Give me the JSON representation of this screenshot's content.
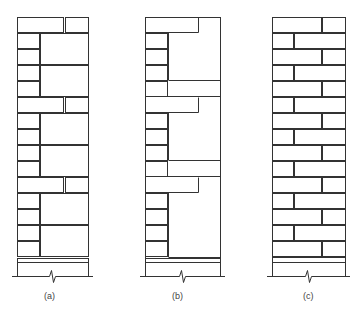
{
  "figure": {
    "type": "masonry-bond-elevations",
    "stroke_color": "#333333",
    "joint_color": "#9a9a9a",
    "panels": [
      {
        "id": "a",
        "caption": "(a)",
        "caption_x": 44,
        "description": "Stacked blocks with alternating half-units and full-height infill blocks",
        "x0": 17,
        "x1": 88,
        "top": 17,
        "bottom": 262,
        "ground": 276,
        "rects": [
          [
            17,
            17,
            46,
            15
          ],
          [
            65,
            17,
            23,
            15
          ],
          [
            17,
            33,
            22,
            15
          ],
          [
            17,
            49,
            22,
            15
          ],
          [
            40,
            33,
            48,
            31
          ],
          [
            17,
            65,
            22,
            15
          ],
          [
            17,
            81,
            22,
            15
          ],
          [
            40,
            65,
            48,
            31
          ],
          [
            17,
            97,
            46,
            15
          ],
          [
            65,
            97,
            23,
            15
          ],
          [
            17,
            113,
            22,
            15
          ],
          [
            17,
            129,
            22,
            15
          ],
          [
            40,
            113,
            48,
            31
          ],
          [
            17,
            145,
            22,
            15
          ],
          [
            17,
            161,
            22,
            15
          ],
          [
            40,
            145,
            48,
            31
          ],
          [
            17,
            177,
            46,
            15
          ],
          [
            65,
            177,
            23,
            15
          ],
          [
            17,
            193,
            22,
            15
          ],
          [
            17,
            209,
            22,
            15
          ],
          [
            40,
            193,
            48,
            31
          ],
          [
            17,
            225,
            22,
            15
          ],
          [
            17,
            241,
            22,
            15
          ],
          [
            40,
            225,
            48,
            31
          ],
          [
            17,
            258,
            71,
            4
          ]
        ]
      },
      {
        "id": "b",
        "caption": "(b)",
        "caption_x": 172,
        "description": "Interlocking L-shaped units with small coursing bricks",
        "x0": 145,
        "x1": 220,
        "top": 17,
        "bottom": 262,
        "ground": 276,
        "rects": [
          [
            145,
            33,
            22,
            15
          ],
          [
            145,
            49,
            22,
            15
          ],
          [
            145,
            65,
            22,
            15
          ],
          [
            145,
            81,
            22,
            15
          ],
          [
            145,
            113,
            22,
            15
          ],
          [
            145,
            129,
            22,
            15
          ],
          [
            145,
            145,
            22,
            15
          ],
          [
            145,
            161,
            22,
            15
          ],
          [
            145,
            193,
            22,
            15
          ],
          [
            145,
            209,
            22,
            15
          ],
          [
            145,
            225,
            22,
            15
          ],
          [
            145,
            241,
            22,
            15
          ],
          [
            145,
            258,
            75,
            4
          ]
        ],
        "polys": [
          "145,17 198,17 198,32 168,32 168,80 220,80 220,17 199,17 199,33 169,33 169,79",
          "169,81 220,81 220,96 169,96",
          "145,97 198,97 198,112 168,112 168,160 220,160 220,97",
          "169,161 220,161 220,176 169,176",
          "145,177 198,177 198,192 168,192 168,257 220,257 220,177"
        ]
      },
      {
        "id": "c",
        "caption": "(c)",
        "caption_x": 303,
        "description": "Running bond (half-bond) brickwork",
        "x0": 272,
        "x1": 345,
        "top": 17,
        "bottom": 262,
        "ground": 276,
        "course_height": 16,
        "courses": 15,
        "long_split": 50,
        "short_split": 22,
        "base_height": 8
      }
    ]
  }
}
